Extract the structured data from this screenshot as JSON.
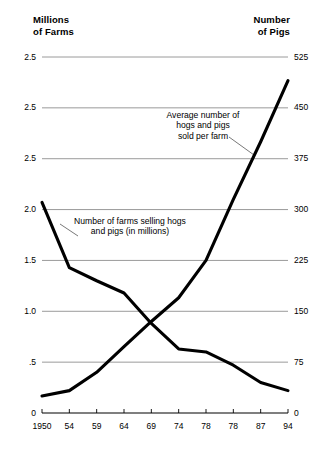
{
  "chart_data": {
    "type": "line",
    "title": "",
    "xlabel": "",
    "ylabel": "Millions of Farms",
    "y2label": "Number of Pigs",
    "grid": true,
    "legend_position": "inline-annotations",
    "x_categories": [
      "1950",
      "54",
      "59",
      "64",
      "69",
      "74",
      "78",
      "78",
      "87",
      "94"
    ],
    "left_axis": {
      "title": "Millions\nof Farms",
      "tick_labels": [
        "2.5",
        "2.5",
        "2.5",
        "2.0",
        "1.5",
        "1.0",
        ".5",
        "0"
      ],
      "tick_values": [
        3.5,
        3.0,
        2.5,
        2.0,
        1.5,
        1.0,
        0.5,
        0
      ],
      "ylim": [
        0,
        3.5
      ]
    },
    "right_axis": {
      "title": "Number\nof Pigs",
      "tick_labels": [
        "525",
        "450",
        "375",
        "300",
        "225",
        "150",
        "75",
        "0"
      ],
      "tick_values": [
        525,
        450,
        375,
        300,
        225,
        150,
        75,
        0
      ],
      "ylim": [
        0,
        525
      ]
    },
    "series": [
      {
        "name": "Number of farms selling hogs and pigs (in millions)",
        "axis": "left",
        "annotation": "Number of farms selling hogs\nand pigs (in millions)",
        "values": [
          2.07,
          1.43,
          1.3,
          1.18,
          0.88,
          0.63,
          0.6,
          0.47,
          0.3,
          0.22
        ]
      },
      {
        "name": "Average number of hogs and pigs sold per farm",
        "axis": "right",
        "annotation": "Average number of\nhogs and pigs\nsold per farm",
        "values": [
          25,
          33,
          60,
          98,
          135,
          170,
          225,
          315,
          400,
          490
        ]
      }
    ],
    "colors": {
      "line": "#000000",
      "grid": "#808080",
      "axis": "#000000",
      "text": "#000000",
      "background": "#ffffff"
    }
  }
}
